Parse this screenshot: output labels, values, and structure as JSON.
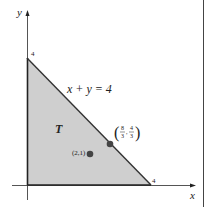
{
  "diagram": {
    "axes": {
      "x_label": "x",
      "y_label": "y"
    },
    "ticks": {
      "x_intercept": "4",
      "y_intercept": "4"
    },
    "line_label": "x + y = 4",
    "region_label": "T",
    "points": [
      {
        "label": "(2,1)",
        "x": 2,
        "y": 1
      },
      {
        "label_num1": "8",
        "label_den1": "3",
        "label_num2": "4",
        "label_den2": "3",
        "x": 2.6667,
        "y": 1.3333
      }
    ],
    "colors": {
      "region_fill": "#cfcfcf",
      "line": "#333333",
      "point": "#444444"
    }
  }
}
